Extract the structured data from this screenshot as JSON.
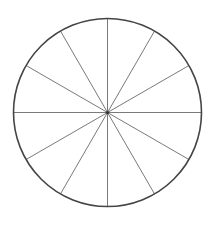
{
  "diagram": {
    "type": "segmented-circle",
    "segments": 12,
    "angle_step_deg": 30,
    "center": {
      "x": 107.5,
      "y": 112.5
    },
    "radius": 94,
    "colors": {
      "background": "#ffffff",
      "outline": "#454545",
      "spokes": "#7a7a7a",
      "hub": "#333333"
    },
    "stroke": {
      "outline": 1.6,
      "spokes": 1
    }
  }
}
